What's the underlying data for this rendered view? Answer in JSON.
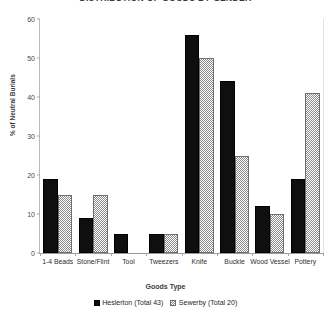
{
  "chart_data": {
    "type": "bar",
    "title": "DISTRIBUTION OF GOODS BY GENDER",
    "xlabel": "Goods Type",
    "ylabel": "% of Neutral Burials",
    "ylim": [
      0,
      60
    ],
    "ytick_step": 10,
    "yticks": [
      "0",
      "10",
      "20",
      "30",
      "40",
      "50",
      "60"
    ],
    "grid": false,
    "legend_position": "bottom",
    "categories": [
      "1-4 Beads",
      "Stone/Flint",
      "Tool",
      "Tweezers",
      "Knife",
      "Buckle",
      "Wood Vessel",
      "Pottery"
    ],
    "series": [
      {
        "name": "Heslerton (Total 43)",
        "pattern": "solid",
        "color": "#100f0f",
        "values": [
          19,
          9,
          5,
          5,
          56,
          44,
          12,
          19
        ]
      },
      {
        "name": "Sewerby (Total 20)",
        "pattern": "hatched",
        "color": "#8c8c8c",
        "values": [
          15,
          15,
          0,
          5,
          50,
          25,
          10,
          41
        ]
      }
    ]
  },
  "legend": {
    "entries": [
      {
        "label": "Heslerton (Total 43)"
      },
      {
        "label": "Sewerby (Total 20)"
      }
    ]
  }
}
